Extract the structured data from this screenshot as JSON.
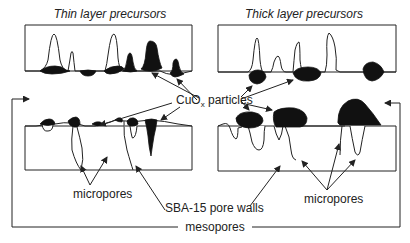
{
  "diagram": {
    "panels": [
      {
        "id": "thin",
        "title": "Thin layer precursors"
      },
      {
        "id": "thick",
        "title": "Thick layer precursors"
      }
    ],
    "labels": {
      "particles": "CuO",
      "particles_subscript": "x",
      "particles_suffix": " particles",
      "micropores_left": "micropores",
      "micropores_right": "micropores",
      "pore_walls": "SBA-15 pore walls",
      "mesopores": "mesopores"
    },
    "colors": {
      "line": "#222222",
      "particle": "#111111",
      "background": "#ffffff"
    }
  }
}
